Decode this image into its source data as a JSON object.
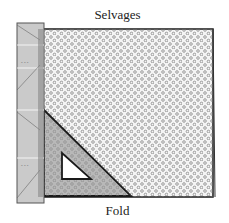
{
  "diagram": {
    "labels": {
      "top": "Selvages",
      "bottom": "Fold"
    },
    "elements": [
      {
        "name": "fabric",
        "description": "Square of dotted fabric folded with selvages at top and fold at bottom"
      },
      {
        "name": "ruler",
        "description": "Vertical ruler along left edge"
      },
      {
        "name": "triangle",
        "description": "Right-angle triangle (set square) in lower-left corner"
      }
    ],
    "colors": {
      "outline": "#1a1a1a",
      "fabric_fill": "#f4f4f4",
      "dots": "#777777",
      "ruler_fill": "#d8d8d8",
      "triangle_fill": "#bdbdbd"
    }
  }
}
